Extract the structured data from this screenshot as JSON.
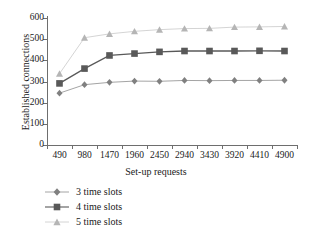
{
  "chart_data": {
    "type": "line",
    "title": "",
    "xlabel": "Set-up requests",
    "ylabel": "Established connections",
    "x": [
      490,
      980,
      1470,
      1960,
      2450,
      2940,
      3430,
      3920,
      4410,
      4900
    ],
    "xticklabels": [
      "490",
      "980",
      "1470",
      "1960",
      "2450",
      "2940",
      "3430",
      "3920",
      "4410",
      "4900"
    ],
    "yticklabels": [
      "0",
      "100",
      "200",
      "300",
      "400",
      "500",
      "600"
    ],
    "yticks": [
      0,
      100,
      200,
      300,
      400,
      500,
      600
    ],
    "ylim": [
      0,
      600
    ],
    "grid": false,
    "legend_position": "below-left",
    "series": [
      {
        "name": "3 time slots",
        "marker": "diamond",
        "color": "#808080",
        "values": [
          245,
          285,
          296,
          302,
          301,
          305,
          304,
          305,
          305,
          306
        ]
      },
      {
        "name": "4 time slots",
        "marker": "square",
        "color": "#595959",
        "values": [
          291,
          361,
          423,
          432,
          440,
          444,
          444,
          444,
          445,
          444
        ]
      },
      {
        "name": "5 time slots",
        "marker": "triangle",
        "color": "#b5b5b5",
        "values": [
          337,
          507,
          525,
          537,
          545,
          550,
          551,
          557,
          558,
          560
        ]
      }
    ]
  },
  "legend": {
    "items": [
      {
        "label": "3 time slots"
      },
      {
        "label": "4 time slots"
      },
      {
        "label": "5 time slots"
      }
    ]
  },
  "colors": {
    "axis": "#6e6e6e",
    "text": "#1a1a1a",
    "background": "#ffffff"
  }
}
